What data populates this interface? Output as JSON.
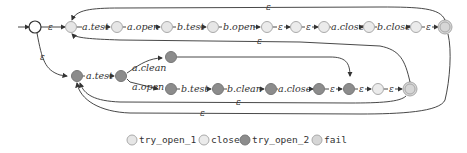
{
  "diagram": {
    "colors": {
      "try_open_1": "#e6e6e6",
      "close": "#ebebeb",
      "try_open_2": "#8c8c8c",
      "fail": "#d6d6d6",
      "start": "#ffffff",
      "stroke": "#999999"
    },
    "top_row_labels": [
      "a.test",
      "a.open",
      "b.test",
      "b.open",
      "ε",
      "ε",
      "a.close",
      "b.close",
      "ε"
    ],
    "start_edge_label": "ε",
    "down_edge_label": "ε",
    "bottom_row_labels": {
      "a_test": "a.test",
      "a_clean": "a.clean",
      "a_open": "a.open",
      "b_test": "b.test",
      "b_clean": "b.clean",
      "a_close": "a.close",
      "eps1": "ε",
      "eps2": "ε",
      "eps3": "ε"
    },
    "loop_labels": {
      "top_loop": "ε",
      "top_return": "ε",
      "bottom_return_1": "ε",
      "bottom_return_2": "ε"
    }
  },
  "legend": [
    {
      "label": "try_open_1",
      "color": "#e6e6e6"
    },
    {
      "label": "close",
      "color": "#ebebeb"
    },
    {
      "label": "try_open_2",
      "color": "#8c8c8c"
    },
    {
      "label": "fail",
      "color": "#d6d6d6"
    }
  ]
}
